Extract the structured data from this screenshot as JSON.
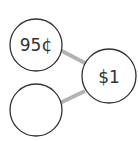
{
  "diagram": {
    "type": "number-bond",
    "whole": {
      "label": "$1",
      "cx": 109,
      "cy": 76,
      "r": 27
    },
    "parts": [
      {
        "label": "95¢",
        "cx": 36,
        "cy": 45,
        "r": 26
      },
      {
        "label": "",
        "cx": 36,
        "cy": 110,
        "r": 26
      }
    ],
    "colors": {
      "stroke": "#333333",
      "connector": "#b3b3b3",
      "background": "#ffffff"
    }
  }
}
